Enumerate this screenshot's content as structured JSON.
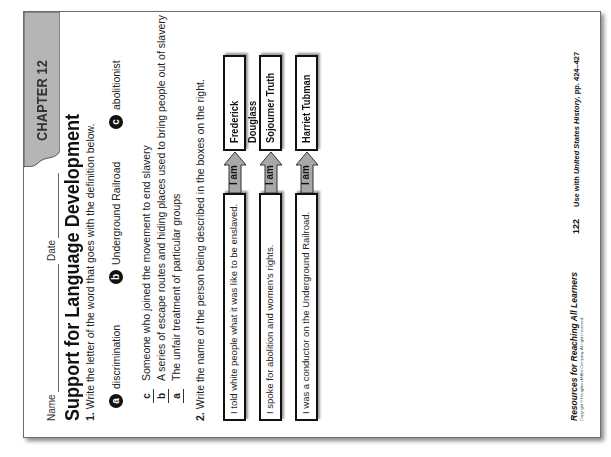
{
  "document": {
    "chapter_tab": "CHAPTER 12",
    "name_label": "Name",
    "date_label": "Date",
    "title": "Support for Language Development",
    "question1": {
      "number": "1.",
      "prompt": "Write the letter of the word that goes with the definition below.",
      "word_bank": [
        {
          "letter": "a",
          "word": "discrimination"
        },
        {
          "letter": "b",
          "word": "Underground Railroad"
        },
        {
          "letter": "c",
          "word": "abolitionist"
        }
      ],
      "items": [
        {
          "answer": "c",
          "definition": "Someone who joined the movement to end slavery"
        },
        {
          "answer": "b",
          "definition": "A series of escape routes and hiding places used to bring people out of slavery"
        },
        {
          "answer": "a",
          "definition": "The unfair treatment of particular groups"
        }
      ]
    },
    "question2": {
      "number": "2.",
      "prompt": "Write the name of the person being described in the boxes on the right.",
      "arrow_label": "I am",
      "rows": [
        {
          "clue": "I told white people what it was like to be enslaved.",
          "name": "Frederick Douglass"
        },
        {
          "clue": "I spoke for abolition and women’s rights.",
          "name": "Sojourner Truth"
        },
        {
          "clue": "I was a conductor on the Underground Railroad.",
          "name": "Harriet Tubman"
        }
      ]
    },
    "footer": {
      "book_title": "Resources for Reaching All Learners",
      "copyright": "Copyright © Houghton Mifflin Company. All rights reserved.",
      "page_number": "122",
      "use_with_prefix": "Use with ",
      "use_with_book": "United States History,",
      "use_with_pages": " pp. 424–427"
    }
  }
}
